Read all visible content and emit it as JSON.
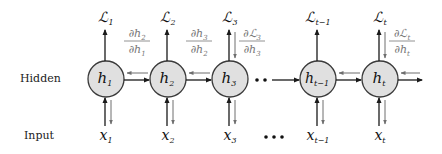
{
  "row_labels": {
    "hidden": "Hidden",
    "input": "Input"
  },
  "nodes": [
    {
      "id": "h1",
      "hidden_base": "h",
      "hidden_sub": "1",
      "loss_base": "ℒ",
      "loss_sub": "1",
      "input_base": "x",
      "input_sub": "1",
      "loss_grad": false
    },
    {
      "id": "h2",
      "hidden_base": "h",
      "hidden_sub": "2",
      "loss_base": "ℒ",
      "loss_sub": "2",
      "input_base": "x",
      "input_sub": "2",
      "loss_grad": false
    },
    {
      "id": "h3",
      "hidden_base": "h",
      "hidden_sub": "3",
      "loss_base": "ℒ",
      "loss_sub": "3",
      "input_base": "x",
      "input_sub": "3",
      "loss_grad": true,
      "grad_num_base": "∂ℒ",
      "grad_num_sub": "3",
      "grad_den_base": "∂h",
      "grad_den_sub": "3"
    },
    {
      "id": "ht-1",
      "hidden_base": "h",
      "hidden_sub": "t−1",
      "loss_base": "ℒ",
      "loss_sub": "t−1",
      "input_base": "x",
      "input_sub": "t−1",
      "loss_grad": false
    },
    {
      "id": "ht",
      "hidden_base": "h",
      "hidden_sub": "t",
      "loss_base": "ℒ",
      "loss_sub": "t",
      "input_base": "x",
      "input_sub": "t",
      "loss_grad": true,
      "grad_num_base": "∂ℒ",
      "grad_num_sub": "t",
      "grad_den_base": "∂h",
      "grad_den_sub": "t"
    }
  ],
  "hidden_gradients": [
    {
      "between": [
        "h1",
        "h2"
      ],
      "num_base": "∂h",
      "num_sub": "2",
      "den_base": "∂h",
      "den_sub": "1"
    },
    {
      "between": [
        "h2",
        "h3"
      ],
      "num_base": "∂h",
      "num_sub": "3",
      "den_base": "∂h",
      "den_sub": "2"
    }
  ],
  "ellipsis": {
    "hidden": "··",
    "input": "•••"
  },
  "colors": {
    "node_fill": "#e0e0e0",
    "forward_arrow": "#1a1a1a",
    "backward_arrow": "#6e6e6e",
    "gradient_text": "#777777"
  }
}
